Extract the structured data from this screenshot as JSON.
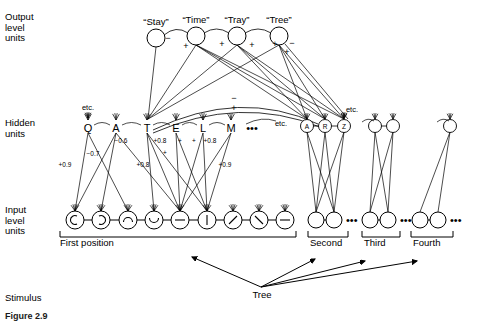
{
  "figure": {
    "caption": "Figure 2.9",
    "row_labels": {
      "output": "Output\nlevel\nunits",
      "hidden": "Hidden\nunits",
      "input": "Input\nlevel\nunits",
      "stimulus": "Stimulus"
    }
  },
  "output_layer": {
    "units": [
      {
        "label": "“Stay”",
        "cx": 156,
        "cy": 38
      },
      {
        "label": "“Time”",
        "cx": 196,
        "cy": 36
      },
      {
        "label": "“Tray”",
        "cx": 237,
        "cy": 36
      },
      {
        "label": "“Tree”",
        "cx": 279,
        "cy": 36
      }
    ],
    "lateral_signs": [
      {
        "text": "−",
        "x": 168,
        "y": 41
      },
      {
        "text": "+",
        "x": 186,
        "y": 49
      },
      {
        "text": "+",
        "x": 222,
        "y": 47
      },
      {
        "text": "+",
        "x": 252,
        "y": 48
      },
      {
        "text": "+",
        "x": 275,
        "y": 47
      },
      {
        "text": "−",
        "x": 292,
        "y": 46
      },
      {
        "text": "+",
        "x": 287,
        "y": 55
      }
    ]
  },
  "hidden_layer": {
    "first_position_letters": [
      "Q",
      "A",
      "T",
      "E",
      "L",
      "M"
    ],
    "first_position_x": [
      88,
      116,
      147,
      176,
      203,
      231
    ],
    "first_position_y": 128,
    "ellipsis": "•••",
    "etc_left": "etc.",
    "etc_mid": "etc.",
    "etc_right": "etc.",
    "arc_signs": [
      {
        "text": "−",
        "x": 234,
        "y": 101
      },
      {
        "text": "+",
        "x": 234,
        "y": 111
      }
    ],
    "second_group_letters": [
      "A",
      "R",
      "Z"
    ],
    "second_group_x": [
      307,
      325,
      344
    ],
    "third_group_x": [
      375,
      393
    ],
    "fourth_group_x": [
      450
    ]
  },
  "weights": [
    {
      "value": "+0.9",
      "x": 65,
      "y": 167
    },
    {
      "value": "−0.7",
      "x": 93,
      "y": 156
    },
    {
      "value": "−0.6",
      "x": 121,
      "y": 143
    },
    {
      "value": "+0.8",
      "x": 143,
      "y": 167
    },
    {
      "value": "+0.8",
      "x": 160,
      "y": 143
    },
    {
      "value": "+",
      "x": 165,
      "y": 155
    },
    {
      "value": "+",
      "x": 180,
      "y": 143
    },
    {
      "value": "+",
      "x": 194,
      "y": 143
    },
    {
      "value": "+0.8",
      "x": 210,
      "y": 143
    },
    {
      "value": "+0.9",
      "x": 225,
      "y": 167
    }
  ],
  "input_layer": {
    "first_position_x": [
      75,
      101,
      128,
      154,
      180,
      207,
      233,
      259,
      285
    ],
    "first_position_y": 220,
    "glyphs": [
      "arc-left",
      "arc-right",
      "arc-up",
      "arc-down",
      "dash",
      "vertical",
      "slash-fwd",
      "slash-back",
      "dash"
    ],
    "groups": [
      {
        "label": "First position",
        "label_x": 60,
        "label_y": 243,
        "bracket_x1": 60,
        "bracket_x2": 296
      },
      {
        "label": "Second",
        "label_x": 310,
        "label_y": 243,
        "bracket_x1": 308,
        "bracket_x2": 348,
        "unit_x": [
          316,
          334
        ],
        "ellipsis": "•••"
      },
      {
        "label": "Third",
        "label_x": 364,
        "label_y": 243,
        "bracket_x1": 362,
        "bracket_x2": 400,
        "unit_x": [
          370,
          388
        ],
        "ellipsis": "•••"
      },
      {
        "label": "Fourth",
        "label_x": 413,
        "label_y": 243,
        "bracket_x1": 411,
        "bracket_x2": 453,
        "unit_x": [
          420,
          438
        ],
        "ellipsis": "•••"
      }
    ]
  },
  "stimulus": {
    "word": "Tree",
    "word_x": 262,
    "word_y": 298,
    "origin": {
      "x": 261,
      "y": 287
    },
    "arrow_targets": [
      {
        "x": 192,
        "y": 257
      },
      {
        "x": 315,
        "y": 259
      },
      {
        "x": 365,
        "y": 261
      },
      {
        "x": 417,
        "y": 261
      }
    ]
  },
  "colors": {
    "ink": "#000000",
    "background": "#ffffff"
  }
}
